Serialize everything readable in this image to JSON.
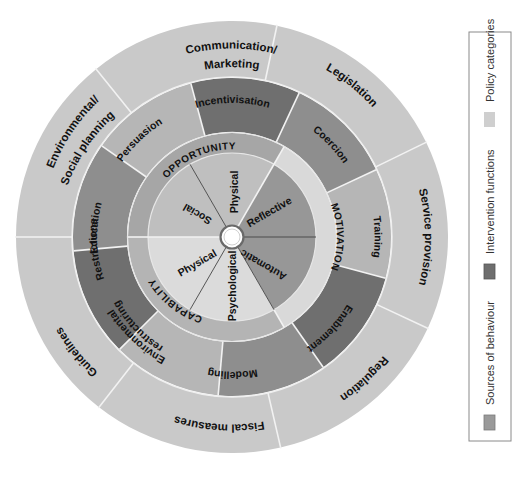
{
  "wheel": {
    "policy_categories": [
      {
        "label": "Communication/",
        "label2": "Marketing"
      },
      {
        "label": "Legislation"
      },
      {
        "label": "Service provision"
      },
      {
        "label": "Regulation"
      },
      {
        "label": "Fiscal measures"
      },
      {
        "label": "Guidelines"
      },
      {
        "label": "Environmental/",
        "label2": "Social planning"
      }
    ],
    "intervention_functions": [
      {
        "label": "Incentivisation"
      },
      {
        "label": "Coercion"
      },
      {
        "label": "Training"
      },
      {
        "label": "Enablement"
      },
      {
        "label": "Modelling"
      },
      {
        "label": "Environmental",
        "label2": "restructuring"
      },
      {
        "label": "Restrictions"
      },
      {
        "label": "Education"
      },
      {
        "label": "Persuasion"
      }
    ],
    "sources_rings": [
      {
        "label": "OPPORTUNITY"
      },
      {
        "label": "MOTIVATION"
      },
      {
        "label": "CAPABILITY"
      }
    ],
    "sources_sectors": [
      {
        "label": "Physical"
      },
      {
        "label": "Reflective"
      },
      {
        "label": "Automatic"
      },
      {
        "label": "Psychological"
      },
      {
        "label": "Physical"
      },
      {
        "label": "Social"
      }
    ]
  },
  "legend": {
    "items": [
      {
        "label": "Sources of behaviour",
        "color": "#9a9a9a"
      },
      {
        "label": "Intervention functions",
        "color": "#6e6e6e"
      },
      {
        "label": "Policy categories",
        "color": "#cfcfcf"
      }
    ]
  },
  "colors": {
    "policy": "#c9c9c9",
    "intervention_dark": "#6f6f6f",
    "intervention_mid": "#8e8e8e",
    "intervention_light": "#b6b6b6",
    "opportunity_ring": "#a6a6a6",
    "opportunity_sector": "#bfbfbf",
    "motivation_ring": "#d9d9d9",
    "motivation_sector": "#979797",
    "capability_ring": "#b4b4b4",
    "capability_sector": "#dbdbdb"
  }
}
